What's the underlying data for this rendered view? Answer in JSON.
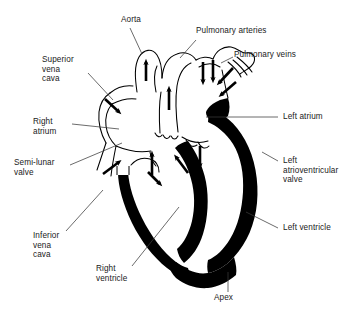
{
  "figure": {
    "type": "anatomical-diagram",
    "style": "black-and-white line drawing with solid filled myocardium and flow arrows",
    "background_color": "#ffffff",
    "ink_color": "#000000",
    "label_color": "#1a1a1a"
  },
  "labels": {
    "aorta": "Aorta",
    "pulmonary_arteries": "Pulmonary arteries",
    "pulmonary_veins": "Pulmonary veins",
    "superior_vena_cava": "Superior\nvena\ncava",
    "right_atrium": "Right\natrium",
    "semi_lunar_valve": "Semi-lunar\nvalve",
    "inferior_vena_cava": "Inferior\nvena\ncava",
    "right_ventricle": "Right\nventricle",
    "apex": "Apex",
    "left_atrium": "Left atrium",
    "left_atrioventricular_valve": "Left\natrioventricular\nvalve",
    "left_ventricle": "Left ventricle"
  },
  "flow_arrows": [
    {
      "name": "aorta-outflow",
      "direction": "up"
    },
    {
      "name": "pulmonary-trunk-outflow",
      "direction": "up"
    },
    {
      "name": "pulmonary-artery-branch-1",
      "direction": "down"
    },
    {
      "name": "pulmonary-artery-branch-2",
      "direction": "down"
    },
    {
      "name": "pulmonary-vein-inflow-1",
      "direction": "down-left"
    },
    {
      "name": "pulmonary-vein-inflow-2",
      "direction": "down-left"
    },
    {
      "name": "superior-vena-cava-inflow",
      "direction": "down-right"
    },
    {
      "name": "inferior-vena-cava-inflow",
      "direction": "up-right"
    },
    {
      "name": "right-ventricle-outflow",
      "direction": "up"
    },
    {
      "name": "right-atrium-to-right-ventricle",
      "direction": "down-right"
    },
    {
      "name": "left-atrium-to-left-ventricle",
      "direction": "down"
    },
    {
      "name": "left-ventricle-outflow",
      "direction": "up-left"
    }
  ]
}
